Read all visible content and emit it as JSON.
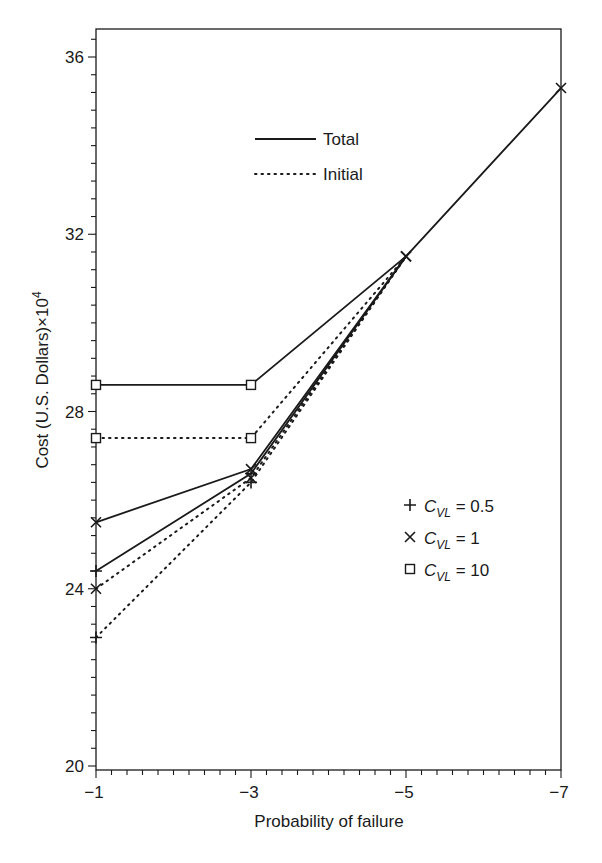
{
  "chart_data": {
    "type": "line",
    "title": "",
    "xlabel": "Probability of failure",
    "ylabel": "Cost (U.S. Dollars)×10^4",
    "x": [
      -1,
      -3,
      -5,
      -7
    ],
    "x_tick_labels": [
      "−1",
      "−3",
      "−5",
      "−7"
    ],
    "y_tick_labels": [
      "20",
      "24",
      "28",
      "32",
      "36"
    ],
    "ylim": [
      20,
      36.6
    ],
    "xlim": [
      -1,
      -7
    ],
    "grid": false,
    "legend_line_styles": [
      {
        "label": "Total",
        "style": "solid"
      },
      {
        "label": "Initial",
        "style": "dotted"
      }
    ],
    "legend_markers": [
      {
        "marker": "+",
        "label_prefix": "C",
        "subscript": "VL",
        "label_suffix": " = 0.5"
      },
      {
        "marker": "×",
        "label_prefix": "C",
        "subscript": "VL",
        "label_suffix": " = 1"
      },
      {
        "marker": "□",
        "label_prefix": "C",
        "subscript": "VL",
        "label_suffix": " = 10"
      }
    ],
    "series": [
      {
        "name": "Total, C_VL = 0.5",
        "style": "solid",
        "marker": "plus",
        "x": [
          -1,
          -3,
          -5
        ],
        "values": [
          24.4,
          26.6,
          31.5
        ]
      },
      {
        "name": "Total, C_VL = 1",
        "style": "solid",
        "marker": "cross",
        "x": [
          -1,
          -3,
          -5,
          -7
        ],
        "values": [
          25.5,
          26.7,
          31.5,
          35.3
        ]
      },
      {
        "name": "Total, C_VL = 10",
        "style": "solid",
        "marker": "square",
        "x": [
          -1,
          -3,
          -5
        ],
        "values": [
          28.6,
          28.6,
          31.5
        ]
      },
      {
        "name": "Initial, C_VL = 0.5",
        "style": "dotted",
        "marker": "plus",
        "x": [
          -1,
          -3,
          -5
        ],
        "values": [
          22.9,
          26.4,
          31.5
        ]
      },
      {
        "name": "Initial, C_VL = 1",
        "style": "dotted",
        "marker": "cross",
        "x": [
          -1,
          -3,
          -5
        ],
        "values": [
          24.0,
          26.5,
          31.5
        ]
      },
      {
        "name": "Initial, C_VL = 10",
        "style": "dotted",
        "marker": "square",
        "x": [
          -1,
          -3,
          -5
        ],
        "values": [
          27.4,
          27.4,
          31.5
        ]
      }
    ]
  }
}
